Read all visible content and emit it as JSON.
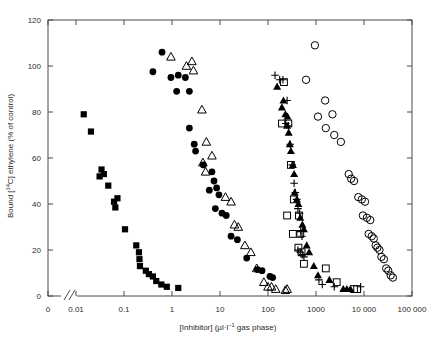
{
  "chart_data": {
    "type": "scatter",
    "title": "",
    "xlabel": "[Inhibitor] (µl·l⁻¹ gas phase)",
    "ylabel": "Bound [¹⁴C] ethylene (% of control)",
    "xscale": "log-with-break",
    "xlim": [
      0.001,
      100000
    ],
    "ylim": [
      0,
      120
    ],
    "grid": false,
    "legend": "none",
    "axis_break": {
      "present": true,
      "between": [
        "0",
        "0.01"
      ],
      "symbol": "//"
    },
    "xticks": [
      {
        "label": "0",
        "value": 0
      },
      {
        "label": "0.01",
        "value": 0.01
      },
      {
        "label": "0.1",
        "value": 0.1
      },
      {
        "label": "1",
        "value": 1
      },
      {
        "label": "10",
        "value": 10
      },
      {
        "label": "100",
        "value": 100
      },
      {
        "label": "1000",
        "value": 1000
      },
      {
        "label": "10 000",
        "value": 10000
      },
      {
        "label": "100 000",
        "value": 100000
      }
    ],
    "yticks": [
      {
        "label": "0",
        "value": 0
      },
      {
        "label": "20",
        "value": 20
      },
      {
        "label": "40",
        "value": 40
      },
      {
        "label": "60",
        "value": 60
      },
      {
        "label": "80",
        "value": 80
      },
      {
        "label": "100",
        "value": 100
      },
      {
        "label": "120",
        "value": 120
      }
    ],
    "series": [
      {
        "name": "filled-square",
        "marker": "filled-square",
        "color": "#000000",
        "points": [
          [
            0.0145,
            79
          ],
          [
            0.0205,
            71.5
          ],
          [
            0.031,
            52
          ],
          [
            0.034,
            55
          ],
          [
            0.038,
            53
          ],
          [
            0.047,
            48
          ],
          [
            0.062,
            41
          ],
          [
            0.066,
            38.5
          ],
          [
            0.073,
            42.5
          ],
          [
            0.105,
            29
          ],
          [
            0.18,
            22
          ],
          [
            0.205,
            19
          ],
          [
            0.21,
            16
          ],
          [
            0.215,
            13
          ],
          [
            0.285,
            11
          ],
          [
            0.33,
            9.5
          ],
          [
            0.4,
            8.5
          ],
          [
            0.47,
            6.5
          ],
          [
            0.6,
            5
          ],
          [
            0.78,
            4
          ],
          [
            1.35,
            3.5
          ]
        ]
      },
      {
        "name": "filled-circle",
        "marker": "filled-circle",
        "color": "#000000",
        "points": [
          [
            0.62,
            106
          ],
          [
            0.4,
            97.5
          ],
          [
            0.95,
            95
          ],
          [
            1.35,
            96
          ],
          [
            1.9,
            95
          ],
          [
            1.25,
            89
          ],
          [
            2.3,
            89
          ],
          [
            2.3,
            73
          ],
          [
            2.9,
            66
          ],
          [
            3.1,
            63
          ],
          [
            4.5,
            57
          ],
          [
            6.8,
            54
          ],
          [
            7.5,
            50
          ],
          [
            8.5,
            47
          ],
          [
            6.0,
            46
          ],
          [
            9.5,
            44
          ],
          [
            8.0,
            38
          ],
          [
            11,
            36
          ],
          [
            13.5,
            35
          ],
          [
            17,
            26
          ],
          [
            23,
            24.5
          ],
          [
            36,
            16.5
          ],
          [
            60,
            11.5
          ],
          [
            75,
            11
          ],
          [
            110,
            8.5
          ],
          [
            125,
            8
          ]
        ]
      },
      {
        "name": "open-triangle",
        "marker": "open-triangle",
        "color": "#000000",
        "points": [
          [
            0.95,
            104
          ],
          [
            2.6,
            102
          ],
          [
            2.8,
            98
          ],
          [
            2.0,
            100
          ],
          [
            4.2,
            81
          ],
          [
            5.2,
            67
          ],
          [
            4.4,
            58
          ],
          [
            6.8,
            61
          ],
          [
            5.0,
            54
          ],
          [
            13,
            43
          ],
          [
            17,
            41
          ],
          [
            20,
            31
          ],
          [
            24,
            30
          ],
          [
            33,
            22
          ],
          [
            44,
            19
          ],
          [
            58,
            12
          ],
          [
            82,
            6
          ],
          [
            100,
            4
          ],
          [
            118,
            4
          ],
          [
            145,
            3
          ],
          [
            230,
            2.5
          ],
          [
            250,
            3
          ]
        ]
      },
      {
        "name": "filled-triangle",
        "marker": "filled-triangle",
        "color": "#000000",
        "points": [
          [
            155,
            91
          ],
          [
            210,
            85
          ],
          [
            195,
            82
          ],
          [
            230,
            79
          ],
          [
            255,
            78
          ],
          [
            250,
            74
          ],
          [
            270,
            71
          ],
          [
            285,
            66
          ],
          [
            300,
            63
          ],
          [
            330,
            57
          ],
          [
            350,
            53
          ],
          [
            360,
            45
          ],
          [
            400,
            42
          ],
          [
            430,
            40
          ],
          [
            470,
            34
          ],
          [
            520,
            31
          ],
          [
            560,
            29
          ],
          [
            640,
            22
          ],
          [
            720,
            19
          ],
          [
            900,
            13
          ],
          [
            1100,
            9
          ],
          [
            1900,
            7
          ],
          [
            3700,
            3
          ],
          [
            4400,
            3
          ],
          [
            5200,
            3
          ]
        ]
      },
      {
        "name": "open-square",
        "marker": "open-square",
        "color": "#000000",
        "points": [
          [
            215,
            93
          ],
          [
            195,
            75
          ],
          [
            265,
            75
          ],
          [
            300,
            57
          ],
          [
            345,
            42
          ],
          [
            250,
            35
          ],
          [
            440,
            35
          ],
          [
            330,
            27
          ],
          [
            470,
            27
          ],
          [
            430,
            21
          ],
          [
            500,
            19
          ],
          [
            560,
            14
          ],
          [
            1600,
            12
          ],
          [
            2700,
            6
          ],
          [
            6200,
            3
          ],
          [
            7200,
            3
          ]
        ]
      },
      {
        "name": "plus",
        "marker": "plus",
        "color": "#000000",
        "points": [
          [
            140,
            96
          ],
          [
            175,
            94
          ],
          [
            205,
            94
          ],
          [
            250,
            85
          ],
          [
            235,
            75
          ],
          [
            265,
            74
          ],
          [
            290,
            66
          ],
          [
            320,
            57
          ],
          [
            350,
            49
          ],
          [
            370,
            45
          ],
          [
            395,
            42
          ],
          [
            420,
            38
          ],
          [
            455,
            36
          ],
          [
            480,
            28
          ],
          [
            510,
            26
          ],
          [
            420,
            20
          ],
          [
            470,
            19
          ],
          [
            520,
            18
          ],
          [
            560,
            17
          ],
          [
            1150,
            7
          ],
          [
            1350,
            5
          ],
          [
            2400,
            4
          ],
          [
            8500,
            4
          ]
        ]
      },
      {
        "name": "open-circle",
        "marker": "open-circle",
        "color": "#000000",
        "points": [
          [
            950,
            109
          ],
          [
            620,
            94
          ],
          [
            1550,
            85
          ],
          [
            1100,
            78
          ],
          [
            2200,
            79
          ],
          [
            1600,
            73
          ],
          [
            2400,
            70
          ],
          [
            3300,
            67
          ],
          [
            4800,
            53
          ],
          [
            5400,
            51
          ],
          [
            6200,
            50
          ],
          [
            7600,
            43
          ],
          [
            9000,
            42
          ],
          [
            10500,
            41
          ],
          [
            9500,
            35
          ],
          [
            11500,
            34
          ],
          [
            13500,
            33
          ],
          [
            12500,
            27
          ],
          [
            14500,
            26
          ],
          [
            16000,
            25
          ],
          [
            17500,
            22
          ],
          [
            19000,
            21
          ],
          [
            21000,
            20
          ],
          [
            23000,
            17
          ],
          [
            26000,
            16
          ],
          [
            29000,
            12
          ],
          [
            32000,
            11
          ],
          [
            36000,
            9
          ],
          [
            40000,
            8
          ]
        ]
      }
    ]
  }
}
